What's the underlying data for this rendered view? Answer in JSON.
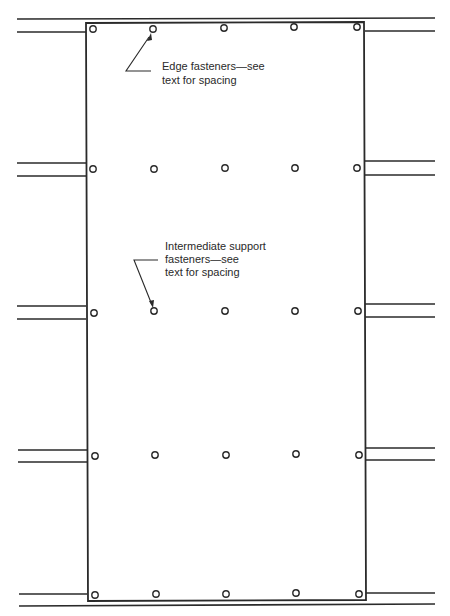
{
  "diagram": {
    "colors": {
      "ink": "#2a2a2a",
      "background": "#ffffff"
    },
    "panel": {
      "x": 86,
      "y": 23,
      "width": 279,
      "height": 578
    },
    "fastener_columns_x": [
      93,
      154,
      225,
      295,
      358
    ],
    "fastener_rows": [
      {
        "name": "top-edge",
        "y": 28
      },
      {
        "name": "support-1",
        "y": 169
      },
      {
        "name": "support-2",
        "y": 312
      },
      {
        "name": "support-3",
        "y": 456
      },
      {
        "name": "bottom-edge",
        "y": 595
      }
    ],
    "annotations": [
      {
        "id": "edge-fasteners",
        "lines": [
          "Edge fasteners—see",
          "text for spacing"
        ],
        "text_x": 162,
        "text_y": [
          70,
          84
        ]
      },
      {
        "id": "intermediate-fasteners",
        "lines": [
          "Intermediate support",
          "fasteners—see",
          "text for spacing"
        ],
        "text_x": 165,
        "text_y": [
          250,
          263,
          276
        ]
      }
    ]
  }
}
